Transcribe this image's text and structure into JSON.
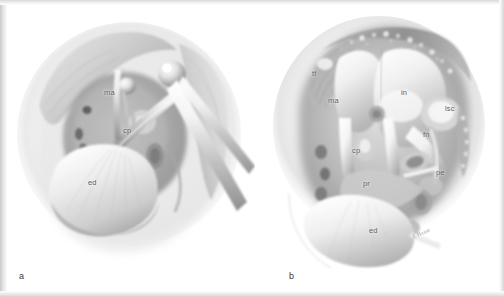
{
  "figure": {
    "domain": "anatomical-illustration",
    "background_color": "#ffffff",
    "ink_color": "#5d5d5d",
    "panels": [
      {
        "id": "a",
        "letter": "a",
        "caption": "",
        "view": "transmastoid surgical exposure with retractors",
        "labels": [
          {
            "key": "ma",
            "text": "ma",
            "meaning": "mastoid antrum",
            "x": 104,
            "y": 86
          },
          {
            "key": "cp",
            "text": "cp",
            "meaning": "cochleariform process",
            "x": 123,
            "y": 124
          },
          {
            "key": "ed",
            "text": "ed",
            "meaning": "endolymphatic duct",
            "x": 88,
            "y": 176
          }
        ]
      },
      {
        "id": "b",
        "letter": "b",
        "caption": "",
        "view": "magnified mastoid cavity with semicircular canal and facial nerve",
        "labels": [
          {
            "key": "tf",
            "text": "tf",
            "meaning": "tegmen / temporal fossa",
            "x": 312,
            "y": 67
          },
          {
            "key": "ma",
            "text": "ma",
            "meaning": "mastoid antrum",
            "x": 329,
            "y": 95
          },
          {
            "key": "in",
            "text": "in",
            "meaning": "incus",
            "x": 401,
            "y": 87
          },
          {
            "key": "lsc",
            "text": "lsc",
            "meaning": "lateral semicircular canal",
            "x": 447,
            "y": 103
          },
          {
            "key": "fn",
            "text": "fn",
            "meaning": "facial nerve",
            "x": 424,
            "y": 128
          },
          {
            "key": "cp",
            "text": "cp",
            "meaning": "cochleariform process",
            "x": 352,
            "y": 144
          },
          {
            "key": "pe",
            "text": "pe",
            "meaning": "pyramidal eminence",
            "x": 436,
            "y": 166
          },
          {
            "key": "pr",
            "text": "pr",
            "meaning": "promontory",
            "x": 363,
            "y": 177
          },
          {
            "key": "ed",
            "text": "ed",
            "meaning": "endolymphatic duct",
            "x": 369,
            "y": 224
          }
        ],
        "artist_credit": {
          "text": "J. Haase",
          "x": 412,
          "y": 228
        }
      }
    ]
  }
}
